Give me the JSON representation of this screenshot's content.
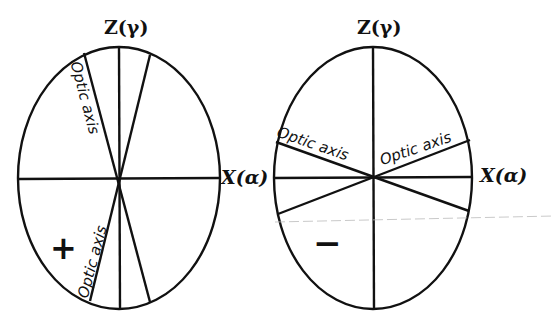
{
  "figure": {
    "left": {
      "sign_label": "positive",
      "sign_glyph": "+",
      "z_label": "Z(γ)",
      "x_label": "X(α)",
      "optic_axis_label_upper": "Optic axis",
      "optic_axis_label_lower": "Optic axis"
    },
    "right": {
      "sign_label": "negative",
      "sign_glyph": "−",
      "z_label": "Z(γ)",
      "x_label": "X(α)",
      "optic_axis_label_left": "Optic axis",
      "optic_axis_label_right": "Optic axis"
    },
    "colors": {
      "ink": "#111111",
      "background": "#ffffff"
    }
  }
}
